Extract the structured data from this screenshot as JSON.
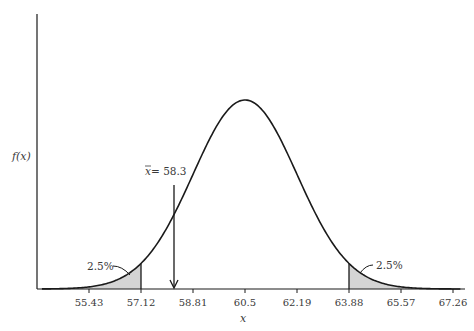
{
  "chart_data": {
    "type": "area",
    "title": "",
    "xlabel": "x",
    "ylabel": "f(x)",
    "distribution": "normal",
    "mean": 60.5,
    "sd": 1.69,
    "x_ticks": [
      "55.43",
      "57.12",
      "58.81",
      "60.5",
      "62.19",
      "63.88",
      "65.57",
      "67.26"
    ],
    "xlim": [
      53.9,
      67.5
    ],
    "grid": false,
    "legend": null,
    "shaded_regions": [
      {
        "name": "lower-tail",
        "from": null,
        "to": 57.12,
        "label": "2.5%"
      },
      {
        "name": "upper-tail",
        "from": 63.88,
        "to": null,
        "label": "2.5%"
      }
    ],
    "annotations": [
      {
        "type": "arrow",
        "x": 58.3,
        "label": "x̄ = 58.3"
      }
    ]
  },
  "labels": {
    "y_axis": "f(x)",
    "x_axis": "x",
    "left_tail": "2.5%",
    "right_tail": "2.5%",
    "sample_mean_symbol": "x",
    "sample_mean_eq": " = 58.3"
  },
  "colors": {
    "curve": "#1a1a1a",
    "shade": "#d4d4d4",
    "axis": "#1a1a1a",
    "text": "#3a3a3a"
  }
}
